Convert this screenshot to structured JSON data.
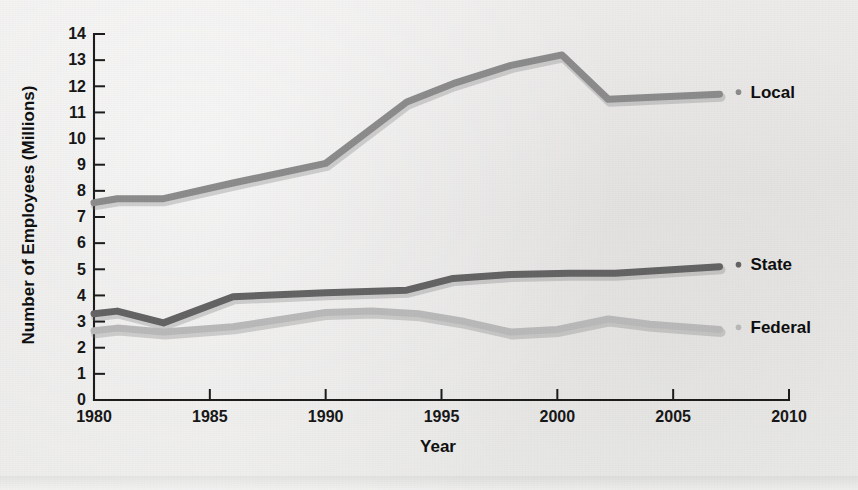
{
  "chart_data": {
    "type": "line",
    "title": "",
    "xlabel": "Year",
    "ylabel": "Number of Employees (Millions)",
    "xlim": [
      1980,
      2010
    ],
    "ylim": [
      0,
      14
    ],
    "xticks": [
      1980,
      1985,
      1990,
      1995,
      2000,
      2005,
      2010
    ],
    "yticks": [
      0,
      1,
      2,
      3,
      4,
      5,
      6,
      7,
      8,
      9,
      10,
      11,
      12,
      13,
      14
    ],
    "xtick_labels": [
      "1980",
      "1985",
      "1990",
      "1995",
      "2000",
      "2005",
      "2010"
    ],
    "ytick_labels": [
      "0",
      "1",
      "2",
      "3",
      "4",
      "5",
      "6",
      "7",
      "8",
      "9",
      "10",
      "11",
      "12",
      "13",
      "14"
    ],
    "grid": false,
    "legend_position": "right-inline-at-line-end",
    "series": [
      {
        "name": "Local",
        "color": "#8b8b8b",
        "x": [
          1980,
          1981,
          1983,
          1986,
          1990,
          1993.5,
          1995.5,
          1998,
          2000.2,
          2002.2,
          2007
        ],
        "values": [
          7.55,
          7.7,
          7.7,
          8.3,
          9.05,
          11.4,
          12.1,
          12.8,
          13.2,
          11.5,
          11.7
        ]
      },
      {
        "name": "State",
        "color": "#636363",
        "x": [
          1980,
          1981,
          1983,
          1986,
          1990,
          1993.5,
          1995.5,
          1998,
          2000.5,
          2002.5,
          2007
        ],
        "values": [
          3.3,
          3.4,
          2.95,
          3.95,
          4.1,
          4.2,
          4.65,
          4.8,
          4.85,
          4.85,
          5.1
        ]
      },
      {
        "name": "Federal",
        "color": "#b9b9b9",
        "x": [
          1980,
          1981,
          1983,
          1986,
          1990,
          1992,
          1994,
          1996,
          1998,
          2000,
          2002.2,
          2004,
          2007
        ],
        "values": [
          2.65,
          2.75,
          2.6,
          2.8,
          3.35,
          3.4,
          3.3,
          3.0,
          2.6,
          2.7,
          3.1,
          2.9,
          2.7
        ]
      }
    ]
  },
  "legend": [
    {
      "label": "Local",
      "color": "#8b8b8b",
      "marker": "dot-marker"
    },
    {
      "label": "State",
      "color": "#636363",
      "marker": "dot-marker"
    },
    {
      "label": "Federal",
      "color": "#b9b9b9",
      "marker": "dot-marker"
    }
  ],
  "colors": {
    "background": "#ececeb",
    "axis": "#1b1b1b",
    "text": "#111111",
    "local": "#8b8b8b",
    "state": "#636363",
    "federal": "#b9b9b9"
  }
}
